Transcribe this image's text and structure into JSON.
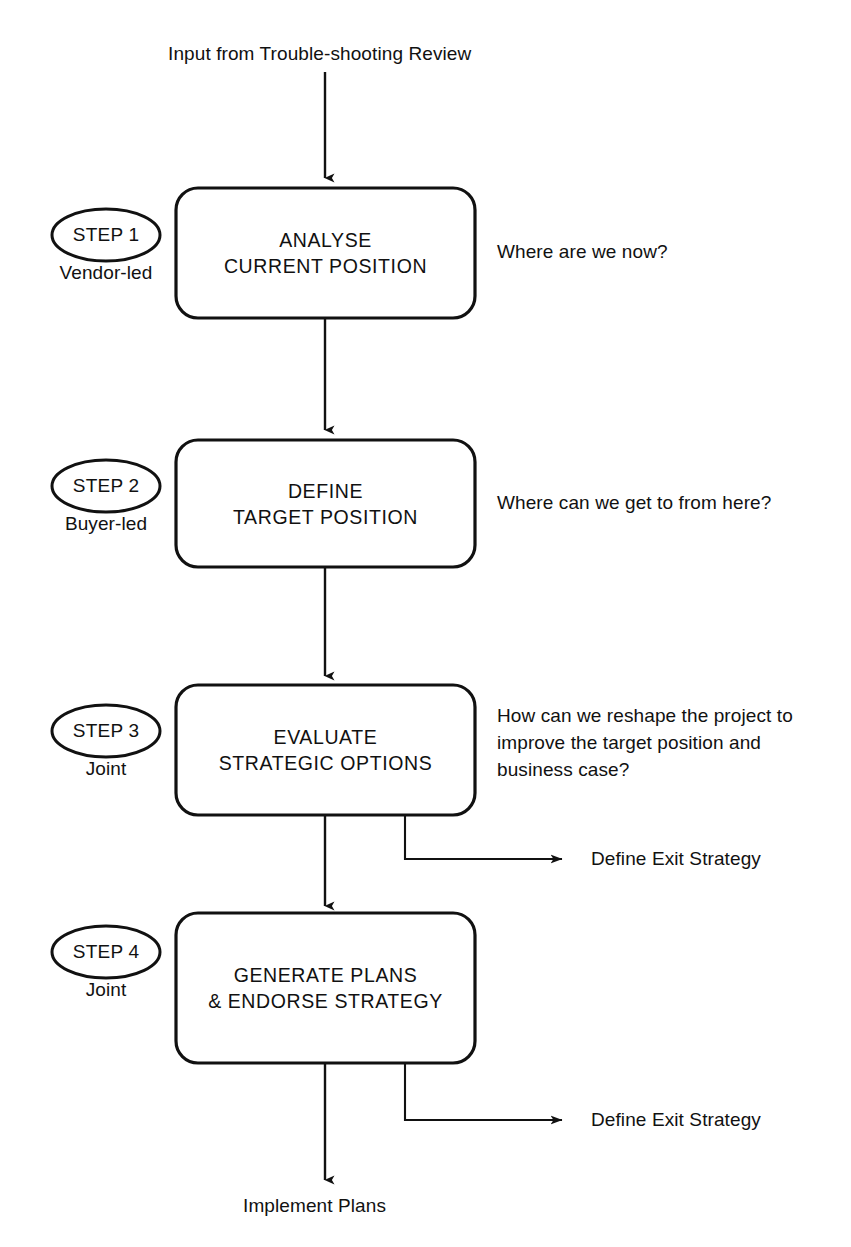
{
  "diagram": {
    "title_label": "Input from Trouble-shooting Review",
    "end_label": "Implement Plans",
    "line_color": "#111111",
    "background": "#ffffff",
    "steps": [
      {
        "badge": "STEP 1",
        "owner": "Vendor-led",
        "title_line1": "ANALYSE",
        "title_line2": "CURRENT POSITION",
        "question_lines": [
          "Where are we now?"
        ]
      },
      {
        "badge": "STEP 2",
        "owner": "Buyer-led",
        "title_line1": "DEFINE",
        "title_line2": "TARGET POSITION",
        "question_lines": [
          "Where can we get to from here?"
        ]
      },
      {
        "badge": "STEP 3",
        "owner": "Joint",
        "title_line1": "EVALUATE",
        "title_line2": "STRATEGIC OPTIONS",
        "question_lines": [
          "How can we reshape the project to",
          "improve the target position and",
          "business case?"
        ],
        "branch_label": "Define Exit Strategy"
      },
      {
        "badge": "STEP 4",
        "owner": "Joint",
        "title_line1": "GENERATE PLANS",
        "title_line2": "& ENDORSE STRATEGY",
        "question_lines": [],
        "branch_label": "Define Exit Strategy"
      }
    ]
  }
}
